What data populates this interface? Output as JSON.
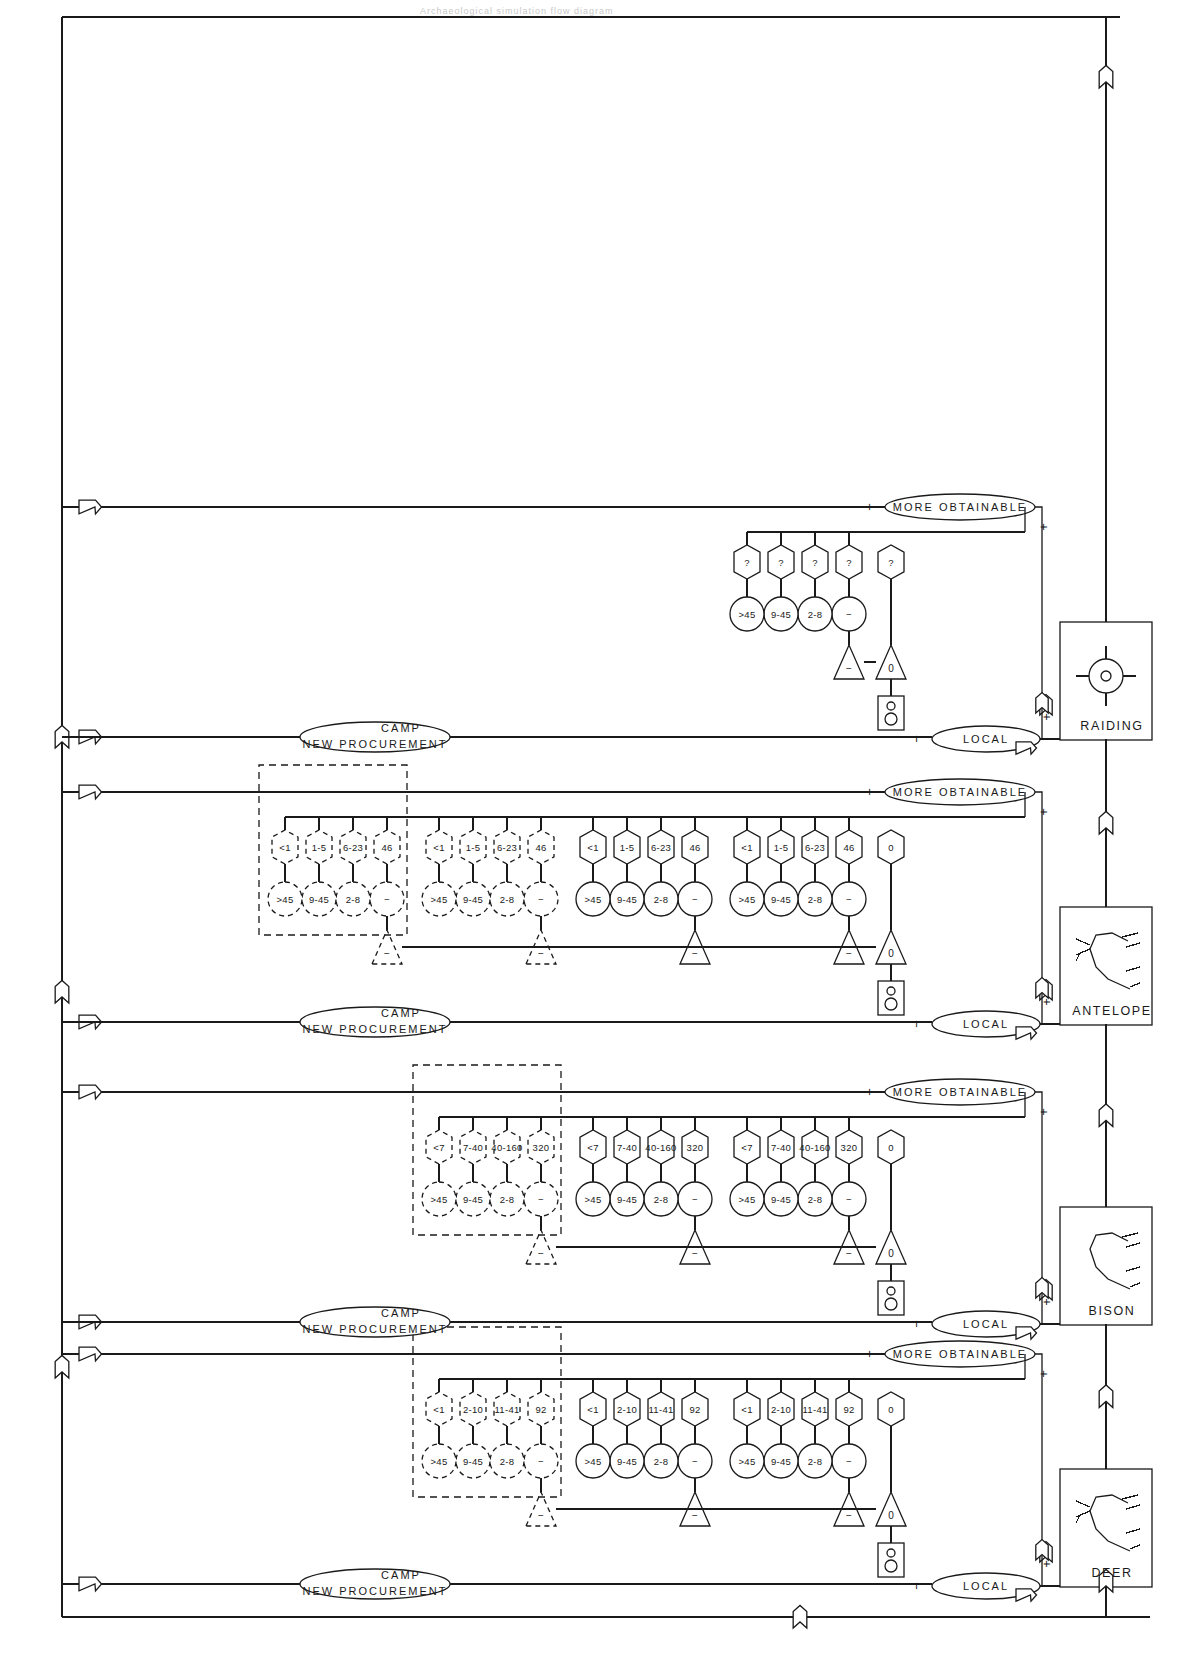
{
  "page": {
    "header_note": "Archaeological simulation flow diagram"
  },
  "labels": {
    "local": "LOCAL",
    "new_camp_line1": "NEW  PROCUREMENT",
    "new_camp_line2": "CAMP",
    "more_obtainable": "MORE OBTAINABLE",
    "plus": "+",
    "minus": "−",
    "op_sum": "−",
    "op_zero": "0",
    "op_gt": ">",
    "question": "?"
  },
  "animals": [
    {
      "id": "deer",
      "name": "DEER",
      "icon": "deer-icon"
    },
    {
      "id": "bison",
      "name": "BISON",
      "icon": "bison-icon"
    },
    {
      "id": "antelope",
      "name": "ANTELOPE",
      "icon": "antelope-icon"
    },
    {
      "id": "raiding",
      "name": "RAIDING",
      "icon": "raiding-icon"
    }
  ],
  "age_classes": [
    "2-8",
    "9-45",
    ">45"
  ],
  "branches": [
    {
      "id": "deer",
      "animal": "DEER",
      "local_label": "LOCAL",
      "camp_label": "NEW  PROCUREMENT",
      "camp_label2": "CAMP",
      "more_label": "MORE OBTAINABLE",
      "zero_node": "0",
      "groups": [
        {
          "kind": "solid",
          "sum": "−",
          "sum_value": "92",
          "circles": [
            "2-8",
            "9-45",
            ">45"
          ],
          "hexes": [
            "11-41",
            "2-10",
            "<1"
          ]
        },
        {
          "kind": "solid",
          "sum": "−",
          "sum_value": "92",
          "circles": [
            "2-8",
            "9-45",
            ">45"
          ],
          "hexes": [
            "11-41",
            "2-10",
            "<1"
          ]
        },
        {
          "kind": "dashed",
          "sum": "−",
          "sum_value": "92",
          "circles": [
            "2-8",
            "9-45",
            ">45"
          ],
          "hexes": [
            "11-41",
            "2-10",
            "<1"
          ]
        }
      ]
    },
    {
      "id": "bison",
      "animal": "BISON",
      "local_label": "LOCAL",
      "camp_label": "NEW  PROCUREMENT",
      "camp_label2": "CAMP",
      "more_label": "MORE OBTAINABLE",
      "zero_node": "0",
      "groups": [
        {
          "kind": "solid",
          "sum": "−",
          "sum_value": "320",
          "circles": [
            "2-8",
            "9-45",
            ">45"
          ],
          "hexes": [
            "40-160",
            "7-40",
            "<7"
          ]
        },
        {
          "kind": "solid",
          "sum": "−",
          "sum_value": "320",
          "circles": [
            "2-8",
            "9-45",
            ">45"
          ],
          "hexes": [
            "40-160",
            "7-40",
            "<7"
          ]
        },
        {
          "kind": "dashed",
          "sum": "−",
          "sum_value": "320",
          "circles": [
            "2-8",
            "9-45",
            ">45"
          ],
          "hexes": [
            "40-160",
            "7-40",
            "<7"
          ]
        }
      ]
    },
    {
      "id": "antelope",
      "animal": "ANTELOPE",
      "local_label": "LOCAL",
      "camp_label": "NEW  PROCUREMENT",
      "camp_label2": "CAMP",
      "more_label": "MORE OBTAINABLE",
      "zero_node": "0",
      "groups": [
        {
          "kind": "solid",
          "sum": "−",
          "sum_value": "46",
          "circles": [
            "2-8",
            "9-45",
            ">45"
          ],
          "hexes": [
            "6-23",
            "1-5",
            "<1"
          ]
        },
        {
          "kind": "solid",
          "sum": "−",
          "sum_value": "46",
          "circles": [
            "2-8",
            "9-45",
            ">45"
          ],
          "hexes": [
            "6-23",
            "1-5",
            "<1"
          ]
        },
        {
          "kind": "dashed",
          "sum": "−",
          "sum_value": "46",
          "circles": [
            "2-8",
            "9-45",
            ">45"
          ],
          "hexes": [
            "6-23",
            "1-5",
            "<1"
          ]
        },
        {
          "kind": "dashed",
          "sum": "−",
          "sum_value": "46",
          "circles": [
            "2-8",
            "9-45",
            ">45"
          ],
          "hexes": [
            "6-23",
            "1-5",
            "<1"
          ]
        }
      ]
    },
    {
      "id": "raiding",
      "animal": "RAIDING",
      "local_label": "LOCAL",
      "camp_label": "NEW  PROCUREMENT",
      "camp_label2": "CAMP",
      "more_label": "MORE OBTAINABLE",
      "zero_node": "?",
      "groups": [
        {
          "kind": "solid",
          "sum": "−",
          "sum_value": "?",
          "circles": [
            "2-8",
            "9-45",
            ">45"
          ],
          "hexes": [
            "?",
            "?",
            "?"
          ]
        }
      ]
    }
  ],
  "colors": {
    "ink": "#1a1a1a",
    "paper": "#ffffff",
    "faint": "#c9c9c9"
  }
}
